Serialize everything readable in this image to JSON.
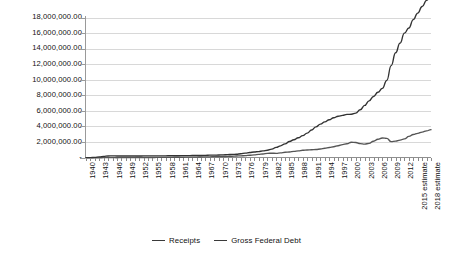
{
  "chart_data": {
    "type": "line",
    "title": "",
    "xlabel": "",
    "ylabel": "",
    "grid": true,
    "legend_position": "bottom",
    "ylim": [
      0,
      18000000
    ],
    "ytick_labels": [
      "18,000,000.00",
      "16,000,000.00",
      "14,000,000.00",
      "12,000,000.00",
      "10,000,000.00",
      "8,000,000.00",
      "6,000,000.00",
      "4,000,000.00",
      "2,000,000.00",
      "-"
    ],
    "ytick_values": [
      18000000,
      16000000,
      14000000,
      12000000,
      10000000,
      8000000,
      6000000,
      4000000,
      2000000,
      0
    ],
    "x": [
      1940,
      1941,
      1942,
      1943,
      1944,
      1945,
      1946,
      1947,
      1948,
      1949,
      1950,
      1951,
      1952,
      1953,
      1954,
      1955,
      1956,
      1957,
      1958,
      1959,
      1960,
      1961,
      1962,
      1963,
      1964,
      1965,
      1966,
      1967,
      1968,
      1969,
      1970,
      1971,
      1972,
      1973,
      1974,
      1975,
      1976,
      1977,
      1978,
      1979,
      1980,
      1981,
      1982,
      1983,
      1984,
      1985,
      1986,
      1987,
      1988,
      1989,
      1990,
      1991,
      1992,
      1993,
      1994,
      1995,
      1996,
      1997,
      1998,
      1999,
      2000,
      2001,
      2002,
      2003,
      2004,
      2005,
      2006,
      2007,
      2008,
      2009,
      2010,
      2011,
      2012,
      2013,
      2014,
      2015,
      2016,
      2017,
      2018
    ],
    "xtick_labels": [
      "1940",
      "1943",
      "1946",
      "1949",
      "1952",
      "1955",
      "1958",
      "1961",
      "1964",
      "1967",
      "1970",
      "1973",
      "1976",
      "1979",
      "1982",
      "1985",
      "1988",
      "1991",
      "1994",
      "1997",
      "2000",
      "2003",
      "2006",
      "2009",
      "2012",
      "2015 estimate",
      "2018 estimate"
    ],
    "xtick_positions": [
      1940,
      1943,
      1946,
      1949,
      1952,
      1955,
      1958,
      1961,
      1964,
      1967,
      1970,
      1973,
      1976,
      1979,
      1982,
      1985,
      1988,
      1991,
      1994,
      1997,
      2000,
      2003,
      2006,
      2009,
      2012,
      2015,
      2018
    ],
    "series": [
      {
        "name": "Receipts",
        "color": "#555555",
        "values": [
          6548,
          8712,
          14634,
          24001,
          43747,
          45159,
          39296,
          38514,
          41560,
          39415,
          39443,
          51616,
          66167,
          69608,
          69701,
          65451,
          74587,
          79990,
          79636,
          79249,
          92492,
          94388,
          99676,
          106560,
          112613,
          116817,
          130835,
          148822,
          152973,
          186882,
          192807,
          187139,
          207309,
          230799,
          263224,
          279090,
          298060,
          355559,
          399561,
          463302,
          517112,
          599272,
          617766,
          600562,
          666438,
          734037,
          769155,
          854288,
          909238,
          991105,
          1031958,
          1054988,
          1091208,
          1154335,
          1258566,
          1351790,
          1453053,
          1579232,
          1721728,
          1827452,
          2025191,
          1991082,
          1853136,
          1782314,
          1880114,
          2153611,
          2406869,
          2567985,
          2523991,
          2104989,
          2162706,
          2303466,
          2449988,
          2775103,
          3021487,
          3176000,
          3336000,
          3487000,
          3643000
        ]
      },
      {
        "name": "Gross Federal Debt",
        "color": "#333333",
        "values": [
          50696,
          57531,
          79200,
          142648,
          204079,
          260123,
          270991,
          257149,
          252031,
          252610,
          256853,
          255288,
          259097,
          265963,
          270812,
          274366,
          272693,
          272252,
          279666,
          287465,
          290525,
          292648,
          302928,
          310324,
          316059,
          322318,
          328498,
          340445,
          368685,
          365769,
          380921,
          408176,
          435936,
          466291,
          483893,
          541925,
          628970,
          706398,
          776602,
          828923,
          908503,
          994298,
          1136798,
          1371164,
          1564110,
          1817423,
          2120082,
          2345578,
          2601104,
          2867800,
          3206290,
          3598178,
          4001787,
          4351044,
          4643307,
          4920586,
          5181465,
          5369206,
          5478189,
          5605523,
          5628700,
          5769881,
          6198401,
          6760014,
          7354657,
          7905300,
          8451350,
          8950744,
          9986082,
          11875851,
          13528807,
          14764222,
          16050921,
          16719434,
          17794483,
          18632000,
          19473000,
          20265000,
          20968000
        ]
      }
    ]
  },
  "legend": {
    "items": [
      {
        "label": "Receipts"
      },
      {
        "label": "Gross Federal Debt"
      }
    ]
  }
}
